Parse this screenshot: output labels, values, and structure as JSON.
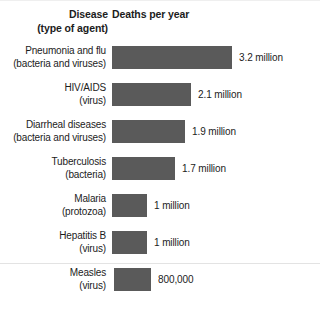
{
  "header": {
    "disease_col_line1": "Disease",
    "disease_col_line2": "(type of agent)",
    "deaths_col": "Deaths per year"
  },
  "chart_data": {
    "type": "bar",
    "orientation": "horizontal",
    "title": "",
    "xlabel": "Deaths per year",
    "ylabel": "Disease (type of agent)",
    "grid": false,
    "legend": "none",
    "bar_color": "#5a5a5a",
    "xlim": [
      0,
      3.2
    ],
    "categories": [
      "Pneumonia and flu (bacteria and viruses)",
      "HIV/AIDS (virus)",
      "Diarrheal diseases (bacteria and viruses)",
      "Tuberculosis (bacteria)",
      "Malaria (protozoa)",
      "Hepatitis B (virus)",
      "Measles (virus)"
    ],
    "values": [
      3200000,
      2100000,
      1900000,
      1700000,
      1000000,
      1000000,
      800000
    ],
    "value_labels": [
      "3.2 million",
      "2.1 million",
      "1.9 million",
      "1.7 million",
      "1 million",
      "1 million",
      "800,000"
    ]
  },
  "rows": [
    {
      "disease": "Pneumonia and flu",
      "agent": "(bacteria and viruses)",
      "value_label": "3.2 million",
      "bar_px": 120,
      "bar_offset_px": 0
    },
    {
      "disease": "HIV/AIDS",
      "agent": "(virus)",
      "value_label": "2.1 million",
      "bar_px": 79,
      "bar_offset_px": 0
    },
    {
      "disease": "Diarrheal diseases",
      "agent": "(bacteria and viruses)",
      "value_label": "1.9 million",
      "bar_px": 73,
      "bar_offset_px": 0
    },
    {
      "disease": "Tuberculosis",
      "agent": "(bacteria)",
      "value_label": "1.7 million",
      "bar_px": 63,
      "bar_offset_px": 0
    },
    {
      "disease": "Malaria",
      "agent": "(protozoa)",
      "value_label": "1 million",
      "bar_px": 35,
      "bar_offset_px": 0
    },
    {
      "disease": "Hepatitis B",
      "agent": "(virus)",
      "value_label": "1 million",
      "bar_px": 35,
      "bar_offset_px": 0
    },
    {
      "disease": "Measles",
      "agent": "(virus)",
      "value_label": "800,000",
      "bar_px": 37,
      "bar_offset_px": 2
    }
  ]
}
